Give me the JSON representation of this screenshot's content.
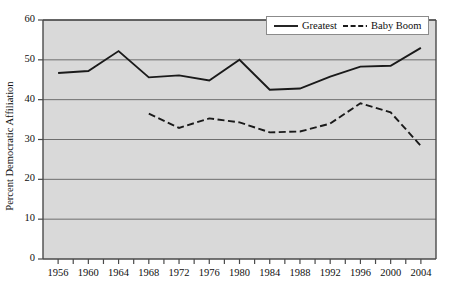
{
  "chart_data": {
    "type": "line",
    "title": "",
    "xlabel": "",
    "ylabel": "Percent Democratic Affiliation",
    "xlim": [
      1954,
      2006
    ],
    "ylim": [
      0,
      60
    ],
    "yticks": [
      0,
      10,
      20,
      30,
      40,
      50,
      60
    ],
    "ytick_labels": [
      "0",
      "10",
      "20",
      "30",
      "40",
      "50",
      "60"
    ],
    "xticks": [
      1956,
      1960,
      1964,
      1968,
      1972,
      1976,
      1980,
      1984,
      1988,
      1992,
      1996,
      2000,
      2004
    ],
    "xtick_labels": [
      "1956",
      "1960",
      "1964",
      "1968",
      "1972",
      "1976",
      "1980",
      "1984",
      "1988",
      "1992",
      "1996",
      "2000",
      "2004"
    ],
    "minor_xticks": [
      1958,
      1962,
      1966,
      1970,
      1974,
      1978,
      1982,
      1986,
      1990,
      1994,
      1998,
      2002
    ],
    "grid": "horizontal",
    "plot_background": "#d9d9d9",
    "grid_color": "#6e6e6e",
    "frame_color": "#4a4a4a",
    "line_color": "#1a1a1a",
    "legend_position": "top-right",
    "series": [
      {
        "name": "Greatest",
        "style": "solid",
        "x": [
          1956,
          1960,
          1964,
          1968,
          1972,
          1976,
          1980,
          1984,
          1988,
          1992,
          1996,
          2000,
          2004
        ],
        "values": [
          46.7,
          47.2,
          52.2,
          45.6,
          46.1,
          44.8,
          50.0,
          42.5,
          42.8,
          45.8,
          48.3,
          48.5,
          53.0
        ]
      },
      {
        "name": "Baby Boom",
        "style": "dashed",
        "x": [
          1968,
          1972,
          1976,
          1980,
          1984,
          1988,
          1992,
          1996,
          2000,
          2004
        ],
        "values": [
          36.5,
          32.9,
          35.3,
          34.3,
          31.8,
          32.0,
          34.0,
          39.1,
          36.8,
          28.4
        ]
      }
    ]
  },
  "legend": {
    "entries": [
      {
        "label": "Greatest",
        "style": "solid"
      },
      {
        "label": "Baby Boom",
        "style": "dashed"
      }
    ]
  }
}
